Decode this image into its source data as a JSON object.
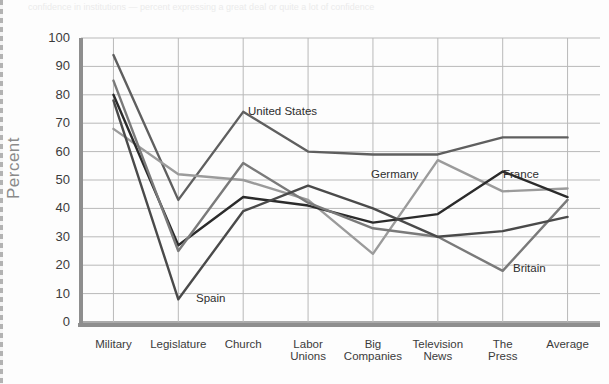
{
  "top_strip_text": "confidence in institutions — percent expressing a great deal or quite a lot of confidence",
  "axes": {
    "ylabel": "Percent",
    "yticks": [
      "100",
      "90",
      "80",
      "70",
      "60",
      "50",
      "40",
      "30",
      "20",
      "10",
      "0"
    ],
    "ymin": 0,
    "ymax": 100,
    "grid": true
  },
  "series_labels": [
    {
      "name": "United States",
      "x": 248,
      "y": 105
    },
    {
      "name": "Germany",
      "x": 371,
      "y": 168
    },
    {
      "name": "France",
      "x": 503,
      "y": 168
    },
    {
      "name": "Britain",
      "x": 513,
      "y": 262
    },
    {
      "name": "Spain",
      "x": 196,
      "y": 292
    }
  ],
  "chart_data": {
    "type": "line",
    "title": "",
    "xlabel": "",
    "ylabel": "Percent",
    "ylim": [
      0,
      100
    ],
    "grid": true,
    "legend": "inline-annotations",
    "categories": [
      "Military",
      "Legislature",
      "Church",
      "Labor Unions",
      "Big Companies",
      "Television News",
      "The Press",
      "Average"
    ],
    "series": [
      {
        "name": "United States",
        "color": "#5f5f5f",
        "width": 2.4,
        "values": [
          94,
          43,
          74,
          60,
          59,
          59,
          65,
          65
        ]
      },
      {
        "name": "Germany",
        "color": "#9b9b9b",
        "width": 2.4,
        "values": [
          68,
          52,
          50,
          43,
          24,
          57,
          46,
          47
        ]
      },
      {
        "name": "France",
        "color": "#2b2b2b",
        "width": 2.4,
        "values": [
          80,
          27,
          44,
          41,
          35,
          38,
          53,
          44
        ]
      },
      {
        "name": "Britain",
        "color": "#7a7a7a",
        "width": 2.4,
        "values": [
          85,
          25,
          56,
          42,
          33,
          30,
          18,
          43
        ]
      },
      {
        "name": "Spain",
        "color": "#4a4a4a",
        "width": 2.4,
        "values": [
          78,
          8,
          39,
          48,
          40,
          30,
          32,
          37
        ]
      }
    ]
  }
}
